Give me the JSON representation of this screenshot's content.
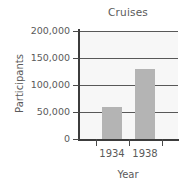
{
  "chart_data": {
    "type": "bar",
    "title": "Cruises",
    "xlabel": "Year",
    "ylabel": "Participants",
    "categories": [
      "1934",
      "1938"
    ],
    "values": [
      60000,
      130000
    ],
    "ylim": [
      0,
      200000
    ],
    "yticks": [
      0,
      50000,
      100000,
      150000,
      200000
    ],
    "ytick_labels": [
      "0",
      "50,000",
      "100,000",
      "150,000",
      "200,000"
    ],
    "grid": true,
    "legend": null,
    "series": [
      {
        "name": "Participants",
        "values": [
          60000,
          130000
        ],
        "color": "#b4b4b4"
      }
    ]
  },
  "style": {
    "bar_color": "#b4b4b4",
    "plot_background": "#f7f7f7",
    "gridline_color": "#585858",
    "axis_color": "#3c3c3c",
    "text_color": "#5a5a5a"
  }
}
